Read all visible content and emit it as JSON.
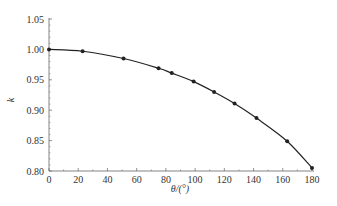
{
  "chart_data": {
    "type": "line",
    "title": "",
    "xlabel": "θ/(°)",
    "ylabel": "k",
    "xlim": [
      0,
      180
    ],
    "ylim": [
      0.8,
      1.05
    ],
    "x_ticks": [
      0,
      20,
      40,
      60,
      80,
      100,
      120,
      140,
      160,
      180
    ],
    "y_ticks": [
      "0.80",
      "0.85",
      "0.90",
      "0.95",
      "1.00",
      "1.05"
    ],
    "grid": false,
    "legend": null,
    "series": [
      {
        "name": "k",
        "style": "line+markers",
        "x": [
          0,
          23,
          51,
          75,
          84,
          99,
          113,
          127,
          142,
          163,
          180
        ],
        "y": [
          1.0,
          0.997,
          0.985,
          0.969,
          0.961,
          0.947,
          0.93,
          0.911,
          0.887,
          0.849,
          0.805
        ]
      }
    ]
  },
  "colors": {
    "line": "#222222",
    "axis": "#666666",
    "text": "#333333"
  }
}
